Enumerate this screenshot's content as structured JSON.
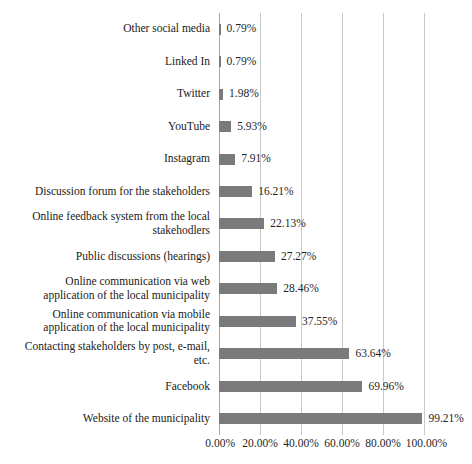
{
  "chart_data": {
    "type": "bar",
    "orientation": "horizontal",
    "title": "",
    "subtitle": "",
    "xlabel": "",
    "ylabel": "",
    "xlim": [
      0,
      100
    ],
    "xtick_labels": [
      "0.00%",
      "20.00%",
      "40.00%",
      "60.00%",
      "80.00%",
      "100.00%"
    ],
    "xticks": [
      0,
      20,
      40,
      60,
      80,
      100
    ],
    "grid": "vertical",
    "legend": "none",
    "bar_color": "#7a7a7a",
    "gridline_color": "#c9c9c9",
    "categories": [
      "Other social media",
      "Linked In",
      "Twitter",
      "YouTube",
      "Instagram",
      "Discussion forum for the stakeholders",
      "Online feedback system from the local stakehodlers",
      "Public discussions (hearings)",
      "Online communication via web application of the local municipality",
      "Online communication via mobile application of the local municipality",
      "Contacting stakeholders by post, e-mail, etc.",
      "Facebook",
      "Website of the municipality"
    ],
    "values": [
      0.79,
      0.79,
      1.98,
      5.93,
      7.91,
      16.21,
      22.13,
      27.27,
      28.46,
      37.55,
      63.64,
      69.96,
      99.21
    ],
    "value_labels": [
      "0.79%",
      "0.79%",
      "1.98%",
      "5.93%",
      "7.91%",
      "16.21%",
      "22.13%",
      "27.27%",
      "28.46%",
      "37.55%",
      "63.64%",
      "69.96%",
      "99.21%"
    ],
    "category_label_lines": [
      [
        "Other social media"
      ],
      [
        "Linked In"
      ],
      [
        "Twitter"
      ],
      [
        "YouTube"
      ],
      [
        "Instagram"
      ],
      [
        "Discussion forum for the stakeholders"
      ],
      [
        "Online feedback system from the local",
        "stakehodlers"
      ],
      [
        "Public discussions (hearings)"
      ],
      [
        "Online communication via web",
        "application of the local municipality"
      ],
      [
        "Online communication via mobile",
        "application of the local municipality"
      ],
      [
        "Contacting stakeholders by post, e-mail,",
        "etc."
      ],
      [
        "Facebook"
      ],
      [
        "Website of the municipality"
      ]
    ]
  }
}
